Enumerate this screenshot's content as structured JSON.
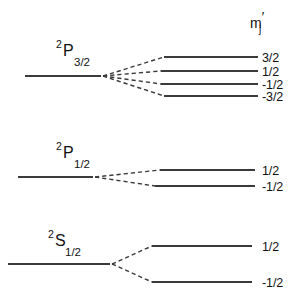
{
  "figure": {
    "background_color": "#ffffff",
    "ink_color": "#3b3b3b",
    "text_color": "#111111",
    "column_header": {
      "symbol": "m",
      "subscript": "j",
      "prime": "′"
    }
  },
  "chart_data": {
    "type": "diagram",
    "title": "",
    "subtitle": "",
    "xlabel": "",
    "ylabel": "",
    "grid": false,
    "legend": false,
    "header_label": "m_j′",
    "groups": [
      {
        "id": "p32",
        "term": {
          "multiplicity": "2",
          "letter": "P",
          "j": "3/2",
          "full": "2P3/2"
        },
        "unsplit_level": {
          "x1": 25,
          "x2": 101,
          "y": 76
        },
        "fan_origin": {
          "x": 103,
          "y": 76
        },
        "sublevels": [
          {
            "mj": "3/2",
            "y": 57,
            "line_x1": 164,
            "line_x2": 258,
            "label_x": 262
          },
          {
            "mj": "1/2",
            "y": 71,
            "line_x1": 161,
            "line_x2": 258,
            "label_x": 262
          },
          {
            "mj": "-1/2",
            "y": 84,
            "line_x1": 161,
            "line_x2": 258,
            "label_x": 262
          },
          {
            "mj": "-3/2",
            "y": 96,
            "line_x1": 164,
            "line_x2": 258,
            "label_x": 262
          }
        ]
      },
      {
        "id": "p12",
        "term": {
          "multiplicity": "2",
          "letter": "P",
          "j": "1/2",
          "full": "2P1/2"
        },
        "unsplit_level": {
          "x1": 18,
          "x2": 93,
          "y": 177
        },
        "fan_origin": {
          "x": 95,
          "y": 177
        },
        "sublevels": [
          {
            "mj": "1/2",
            "y": 170,
            "line_x1": 160,
            "line_x2": 255,
            "label_x": 262
          },
          {
            "mj": "-1/2",
            "y": 186,
            "line_x1": 155,
            "line_x2": 255,
            "label_x": 262
          }
        ]
      },
      {
        "id": "s12",
        "term": {
          "multiplicity": "2",
          "letter": "S",
          "j": "1/2",
          "full": "2S1/2"
        },
        "unsplit_level": {
          "x1": 8,
          "x2": 110,
          "y": 264
        },
        "fan_origin": {
          "x": 112,
          "y": 264
        },
        "sublevels": [
          {
            "mj": "1/2",
            "y": 246,
            "line_x1": 152,
            "line_x2": 252,
            "label_x": 262
          },
          {
            "mj": "-1/2",
            "y": 282,
            "line_x1": 152,
            "line_x2": 252,
            "label_x": 262
          }
        ]
      }
    ],
    "term_label_positions": [
      {
        "id": "p32",
        "sup_x": 56,
        "sup_y": 48,
        "letter_x": 63,
        "letter_y": 56,
        "sub_x": 74,
        "sub_y": 66
      },
      {
        "id": "p12",
        "sup_x": 56,
        "sup_y": 150,
        "letter_x": 63,
        "letter_y": 158,
        "sub_x": 74,
        "sub_y": 168
      },
      {
        "id": "s12",
        "sup_x": 48,
        "sup_y": 238,
        "letter_x": 55,
        "letter_y": 246,
        "sub_x": 65,
        "sub_y": 256
      }
    ],
    "header_position": {
      "x": 250,
      "y": 28
    }
  }
}
